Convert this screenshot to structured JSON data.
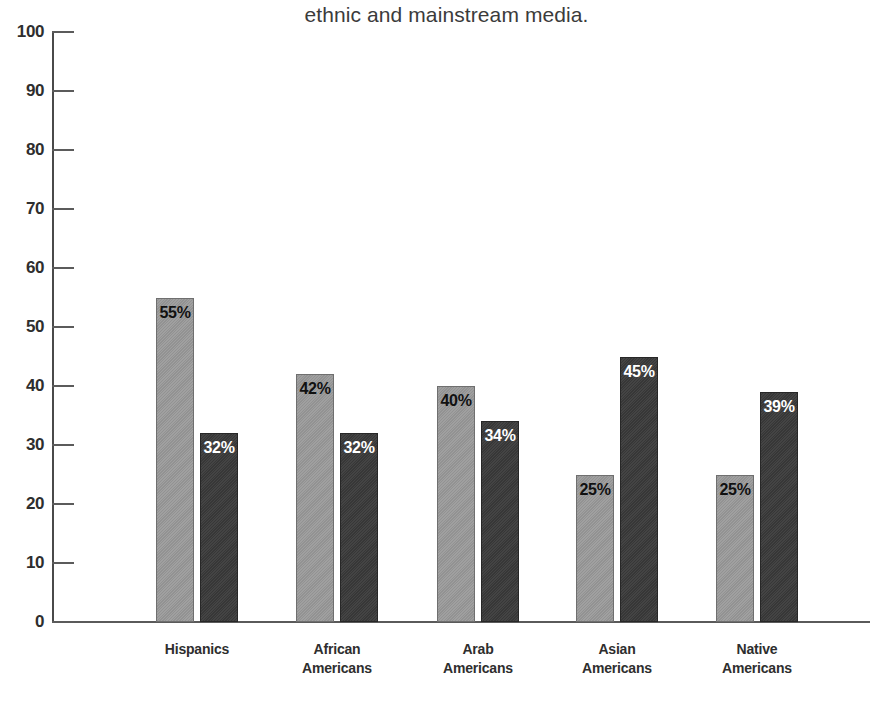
{
  "caption": {
    "text": "ethnic and mainstream media."
  },
  "chart_data": {
    "type": "bar",
    "title": "ethnic and mainstream media.",
    "xlabel": "",
    "ylabel": "",
    "ylim": [
      0,
      100
    ],
    "yticks": [
      0,
      10,
      20,
      30,
      40,
      50,
      60,
      70,
      80,
      90,
      100
    ],
    "ytick_labels": [
      "0",
      "10",
      "20",
      "30",
      "40",
      "50",
      "60",
      "70",
      "80",
      "90",
      "100"
    ],
    "grid": false,
    "legend": "none",
    "value_suffix": "%",
    "categories": [
      {
        "line1": "Hispanics",
        "line2": ""
      },
      {
        "line1": "African",
        "line2": "Americans"
      },
      {
        "line1": "Arab",
        "line2": "Americans"
      },
      {
        "line1": "Asian",
        "line2": "Americans"
      },
      {
        "line1": "Native",
        "line2": "Americans"
      }
    ],
    "series": [
      {
        "name": "series-light",
        "color": "#9a9a9a",
        "label_color": "#111111",
        "values": [
          55,
          42,
          40,
          25,
          25
        ],
        "labels": [
          "55%",
          "42%",
          "40%",
          "25%",
          "25%"
        ]
      },
      {
        "name": "series-dark",
        "color": "#3a3a3a",
        "label_color": "#ffffff",
        "values": [
          32,
          32,
          34,
          45,
          39
        ],
        "labels": [
          "32%",
          "32%",
          "34%",
          "45%",
          "39%"
        ]
      }
    ]
  },
  "colors": {
    "light_bar": "#9a9a9a",
    "dark_bar": "#3a3a3a",
    "axis": "#4a4a4a",
    "text": "#2e2e2e",
    "background": "#ffffff"
  }
}
